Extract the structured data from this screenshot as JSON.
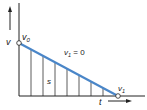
{
  "diagram": {
    "type": "velocity-time graph",
    "labels": {
      "y_axis": "v",
      "x_axis": "t",
      "start_point": "v",
      "start_sub": "0",
      "end_point": "v",
      "end_sub": "1",
      "condition": "v",
      "condition_sub": "1",
      "condition_rest": " = 0",
      "area": "s"
    },
    "colors": {
      "line": "#4a86c8",
      "axis": "#222222",
      "hatch": "#333333"
    }
  }
}
